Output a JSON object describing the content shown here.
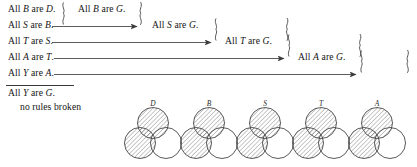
{
  "figure": {
    "type": "logic-syllogism-chain",
    "premises": [
      {
        "id": "p1",
        "text": "All B are D.",
        "subject": "B",
        "predicate": "D",
        "x": 8,
        "y": 4
      },
      {
        "id": "p2",
        "text": "All S are B.",
        "subject": "S",
        "predicate": "B",
        "x": 8,
        "y": 20
      },
      {
        "id": "p3",
        "text": "All T are S.",
        "subject": "T",
        "predicate": "S",
        "x": 8,
        "y": 36
      },
      {
        "id": "p4",
        "text": "All A are T.",
        "subject": "A",
        "predicate": "T",
        "x": 8,
        "y": 52
      },
      {
        "id": "p5",
        "text": "All Y are A.",
        "subject": "Y",
        "predicate": "A",
        "x": 8,
        "y": 68
      }
    ],
    "derived": [
      {
        "id": "d1",
        "text": "All B are G.",
        "subject": "B",
        "predicate": "G",
        "x": 78,
        "y": 4
      },
      {
        "id": "d2",
        "text": "All S are G.",
        "subject": "S",
        "predicate": "G",
        "x": 152,
        "y": 20
      },
      {
        "id": "d3",
        "text": "All T are G.",
        "subject": "T",
        "predicate": "G",
        "x": 225,
        "y": 36
      },
      {
        "id": "d4",
        "text": "All A are G.",
        "subject": "A",
        "predicate": "G",
        "x": 298,
        "y": 52
      }
    ],
    "conclusion": {
      "text": "All Y are G.",
      "x": 8,
      "y": 88
    },
    "note": {
      "text": "no rules broken",
      "x": 20,
      "y": 102
    },
    "divider": {
      "x": 6,
      "y": 85,
      "width": 68
    },
    "arrows": [
      {
        "from": "p2",
        "to": "d1",
        "x1": 52,
        "x2": 138,
        "y": 26
      },
      {
        "from": "p3",
        "to": "d2",
        "x1": 52,
        "x2": 212,
        "y": 42
      },
      {
        "from": "p4",
        "to": "d3",
        "x1": 54,
        "x2": 285,
        "y": 58
      },
      {
        "from": "p5",
        "to": "d4",
        "x1": 54,
        "x2": 357,
        "y": 74
      }
    ],
    "braces": [
      {
        "kind": "open",
        "x": 62,
        "yTop": 1,
        "yBottom": 29
      },
      {
        "kind": "close",
        "x": 140,
        "yTop": 1,
        "yBottom": 29
      },
      {
        "kind": "open",
        "x": 215,
        "yTop": 17,
        "yBottom": 45
      },
      {
        "kind": "close",
        "x": 214,
        "yTop": 17,
        "yBottom": 45
      },
      {
        "kind": "open",
        "x": 288,
        "yTop": 33,
        "yBottom": 61
      },
      {
        "kind": "close",
        "x": 287,
        "yTop": 33,
        "yBottom": 61
      },
      {
        "kind": "open",
        "x": 360,
        "yTop": 49,
        "yBottom": 77
      },
      {
        "kind": "close",
        "x": 359,
        "yTop": 49,
        "yBottom": 77
      }
    ]
  },
  "venn_diagrams": {
    "count": 5,
    "hatched_regions": [
      "top-circle",
      "bottom-left-circle"
    ],
    "stroke_color": "#3c3c3c",
    "hatch_color": "#6e6e6e",
    "items": [
      {
        "label": "D",
        "cx": 153,
        "cy": 135
      },
      {
        "label": "B",
        "cx": 209,
        "cy": 135
      },
      {
        "label": "S",
        "cx": 265,
        "cy": 135
      },
      {
        "label": "T",
        "cx": 321,
        "cy": 135
      },
      {
        "label": "A",
        "cx": 377,
        "cy": 135
      }
    ]
  }
}
